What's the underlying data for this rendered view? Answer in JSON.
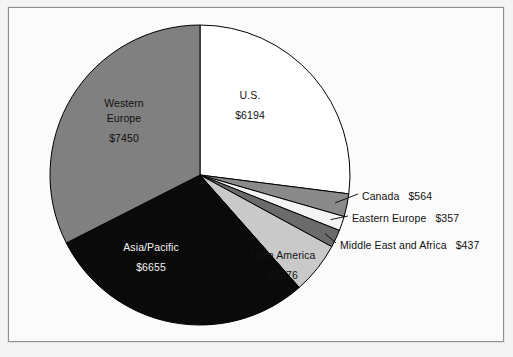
{
  "chart_data": {
    "type": "pie",
    "title": "",
    "subtitle": "",
    "xlabel": "",
    "ylabel": "",
    "value_prefix": "$",
    "legend_position": "none",
    "grid": false,
    "total": 22933,
    "start_angle_deg": 0,
    "direction": "clockwise",
    "categories": [
      "U.S.",
      "Canada",
      "Eastern Europe",
      "Middle East and Africa",
      "Latin America",
      "Asia/Pacific",
      "Western Europe"
    ],
    "values": [
      6194,
      564,
      357,
      437,
      1276,
      6655,
      7450
    ],
    "labels_formatted": [
      "$6194",
      "$564",
      "$357",
      "$437",
      "$1276",
      "$6655",
      "$7450"
    ],
    "colors": [
      "#ffffff",
      "#8a8a8a",
      "#f4f4f4",
      "#6b6b6b",
      "#c9c9c9",
      "#0a0a0a",
      "#808080"
    ],
    "slices": [
      {
        "name": "U.S.",
        "value": 6194,
        "value_label": "$6194",
        "color": "#ffffff",
        "label_placement": "inside",
        "text_color": "dark"
      },
      {
        "name": "Canada",
        "value": 564,
        "value_label": "$564",
        "color": "#8a8a8a",
        "label_placement": "callout",
        "text_color": "dark"
      },
      {
        "name": "Eastern Europe",
        "value": 357,
        "value_label": "$357",
        "color": "#f4f4f4",
        "label_placement": "callout",
        "text_color": "dark"
      },
      {
        "name": "Middle East and Africa",
        "value": 437,
        "value_label": "$437",
        "color": "#6b6b6b",
        "label_placement": "callout",
        "text_color": "dark"
      },
      {
        "name": "Latin America",
        "value": 1276,
        "value_label": "$1276",
        "color": "#c9c9c9",
        "label_placement": "inside",
        "text_color": "dark"
      },
      {
        "name": "Asia/Pacific",
        "value": 6655,
        "value_label": "$6655",
        "color": "#0a0a0a",
        "label_placement": "inside",
        "text_color": "light"
      },
      {
        "name": "Western Europe",
        "value": 7450,
        "value_label": "$7450",
        "color": "#808080",
        "label_placement": "inside",
        "text_color": "dark"
      }
    ]
  },
  "inside_labels": {
    "us": {
      "name": "U.S.",
      "value": "$6194"
    },
    "western_europe": {
      "name_line1": "Western",
      "name_line2": "Europe",
      "value": "$7450"
    },
    "asia_pacific": {
      "name": "Asia/Pacific",
      "value": "$6655"
    },
    "latin_america": {
      "name": "Latin America",
      "value": "$1276"
    }
  },
  "callouts": {
    "canada": {
      "name": "Canada",
      "value": "$564"
    },
    "eastern_europe": {
      "name": "Eastern Europe",
      "value": "$357"
    },
    "middle_east": {
      "name": "Middle East and Africa",
      "value": "$437"
    }
  },
  "style": {
    "frame_border": "#8e8e8e",
    "page_background": "#f4f4f4",
    "chart_background": "#fbfbfb",
    "outline": "#000000"
  }
}
